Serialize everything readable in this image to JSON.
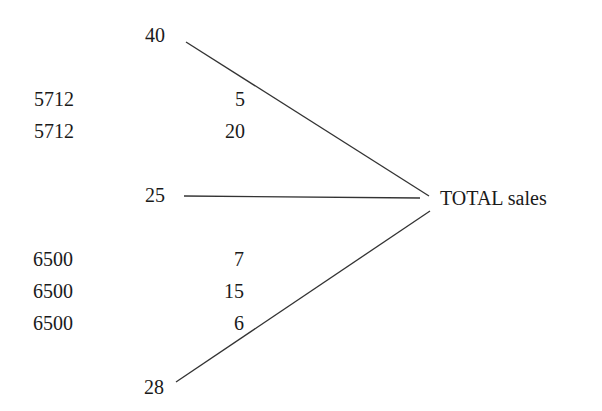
{
  "diagram": {
    "target": {
      "label": "TOTAL sales"
    },
    "groups": [
      {
        "total": "40",
        "rows": [
          {
            "key": "5712",
            "value": "5"
          },
          {
            "key": "5712",
            "value": "20"
          }
        ]
      },
      {
        "total": "25",
        "rows": []
      },
      {
        "total": "28",
        "rows": [
          {
            "key": "6500",
            "value": "7"
          },
          {
            "key": "6500",
            "value": "15"
          },
          {
            "key": "6500",
            "value": "6"
          }
        ]
      }
    ],
    "line_color": "#333333"
  }
}
